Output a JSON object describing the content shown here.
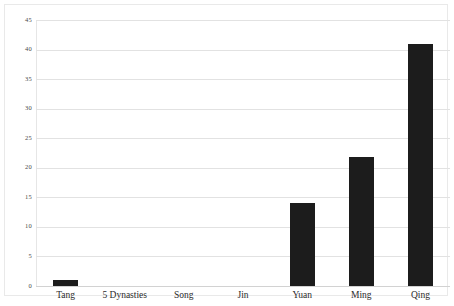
{
  "chart_data": {
    "type": "bar",
    "title": "",
    "subtitle": "",
    "xlabel": "",
    "ylabel": "",
    "categories": [
      "Tang",
      "5 Dynasties",
      "Song",
      "Jin",
      "Yuan",
      "Ming",
      "Qing"
    ],
    "values": [
      1,
      0,
      0,
      0,
      14,
      21.8,
      41
    ],
    "series": [
      {
        "name": "count",
        "values": [
          1,
          0,
          0,
          0,
          14,
          21.8,
          41
        ]
      }
    ],
    "ylim": [
      0,
      45
    ],
    "ytick_labels": [
      "0",
      "5",
      "10",
      "15",
      "20",
      "25",
      "30",
      "35",
      "40",
      "45"
    ],
    "ytick_values": [
      0,
      5,
      10,
      15,
      20,
      25,
      30,
      35,
      40,
      45
    ],
    "grid": true,
    "legend": false,
    "legend_position": "none",
    "bar_color": "#1c1c1c",
    "gridline_color": "#e2e2e2",
    "background_color": "#ffffff"
  }
}
